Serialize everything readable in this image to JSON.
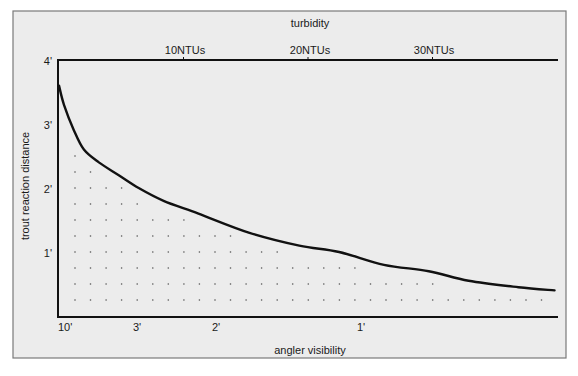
{
  "chart_data": {
    "type": "area",
    "title": "",
    "top_axis": {
      "label": "turbidity",
      "unit": "NTU",
      "ticks": [
        {
          "value": 10,
          "label": "10NTUs"
        },
        {
          "value": 20,
          "label": "20NTUs"
        },
        {
          "value": 30,
          "label": "30NTUs"
        }
      ],
      "range": [
        0,
        40
      ]
    },
    "bottom_axis": {
      "label": "angler visibility",
      "ticks": [
        {
          "ntu": 0.3,
          "label": "10'"
        },
        {
          "ntu": 6.0,
          "label": "3'"
        },
        {
          "ntu": 12.4,
          "label": "2'"
        },
        {
          "ntu": 24.2,
          "label": "1'"
        }
      ]
    },
    "y_axis": {
      "label": "trout reaction distance",
      "unit": "feet",
      "ticks": [
        {
          "value": 1,
          "label": "1'"
        },
        {
          "value": 2,
          "label": "2'"
        },
        {
          "value": 3,
          "label": "3'"
        },
        {
          "value": 4,
          "label": "4'"
        }
      ],
      "range": [
        0,
        4
      ]
    },
    "xlabel": "angler visibility",
    "ylabel": "trout reaction distance",
    "series": [
      {
        "name": "trout reaction distance vs turbidity",
        "x": [
          0,
          0.4,
          1.2,
          2.0,
          3.2,
          4.8,
          6.4,
          8.4,
          11.2,
          15.3,
          19.3,
          22.5,
          26.1,
          29.7,
          32.9,
          36.9,
          39.8
        ],
        "y": [
          3.6,
          3.3,
          2.9,
          2.6,
          2.4,
          2.2,
          2.0,
          1.8,
          1.6,
          1.3,
          1.1,
          1.0,
          0.8,
          0.7,
          0.55,
          0.45,
          0.4
        ]
      }
    ],
    "fill": "dotted pattern under curve",
    "grid": false,
    "legend": "none"
  },
  "colors": {
    "panel_background": "#ececec",
    "page_background": "#ffffff",
    "frame": "#7a7a7a",
    "axis_line": "#111111",
    "curve": "#111111",
    "dots": "#555555",
    "text": "#1a1a1a"
  }
}
